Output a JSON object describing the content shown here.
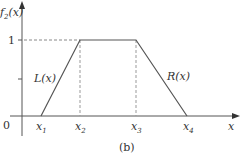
{
  "diagram": {
    "type": "trapezoidal-membership-function",
    "caption": "(b)",
    "y_axis_label": {
      "main": "f",
      "sub": "2",
      "arg": "(x)"
    },
    "x_axis_label": "x",
    "origin_label": "0",
    "level_label": "1",
    "x_ticks": [
      {
        "main": "x",
        "sub": "1"
      },
      {
        "main": "x",
        "sub": "2"
      },
      {
        "main": "x",
        "sub": "3"
      },
      {
        "main": "x",
        "sub": "4"
      }
    ],
    "left_curve_label": "L(x)",
    "right_curve_label": "R(x)",
    "points": [
      {
        "name": "x1",
        "x": 41,
        "y": 116
      },
      {
        "name": "x2",
        "x": 80,
        "y": 40
      },
      {
        "name": "x3",
        "x": 136,
        "y": 40
      },
      {
        "name": "x4",
        "x": 187,
        "y": 116
      }
    ],
    "colors": {
      "line": "#555555",
      "dashed": "#888888",
      "text": "#333333"
    }
  }
}
